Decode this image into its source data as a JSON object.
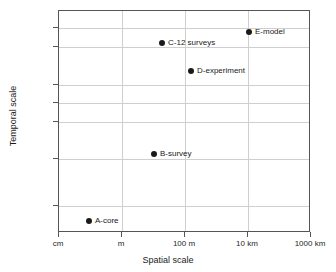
{
  "chart_data": {
    "type": "scatter",
    "title": "",
    "xlabel": "Spatial scale",
    "ylabel": "Temporal scale",
    "grid": true,
    "legend": "none",
    "x_tick_labels": [
      "cm",
      "m",
      "100 m",
      "10 km",
      "1000 km"
    ],
    "y_tick_labels": [
      "decade",
      "year",
      "month",
      "week",
      "day",
      "hour",
      "minute"
    ],
    "xlim": [
      "cm",
      "1000 km"
    ],
    "ylim": [
      "below minute",
      "above decade"
    ],
    "points": [
      {
        "label": "A-core",
        "x": "30 cm",
        "y": "under a minute"
      },
      {
        "label": "B-survey",
        "x": "50 m",
        "y": "hour"
      },
      {
        "label": "C-12 surveys",
        "x": "150 m",
        "y": "year"
      },
      {
        "label": "D-experiment",
        "x": "700 m",
        "y": "few months"
      },
      {
        "label": "E-model",
        "x": "10 km",
        "y": "decade"
      }
    ],
    "colors": {
      "marker": "#1a1a1a",
      "grid": "#cfcfcf",
      "frame": "#555555",
      "text": "#1a1a1a"
    }
  },
  "axes": {
    "x_ticks": [
      {
        "label": "cm",
        "pos_pct": 0
      },
      {
        "label": "m",
        "pos_pct": 25
      },
      {
        "label": "100 m",
        "pos_pct": 50
      },
      {
        "label": "10 km",
        "pos_pct": 75
      },
      {
        "label": "1000 km",
        "pos_pct": 100
      }
    ],
    "y_ticks": [
      {
        "label": "decade",
        "pos_px": 17
      },
      {
        "label": "year",
        "pos_px": 36
      },
      {
        "label": "month",
        "pos_px": 74
      },
      {
        "label": "week",
        "pos_px": 92
      },
      {
        "label": "day",
        "pos_px": 111
      },
      {
        "label": "hour",
        "pos_px": 148
      },
      {
        "label": "minute",
        "pos_px": 195
      }
    ]
  },
  "markers": [
    {
      "name": "A-core",
      "label": "A-core",
      "left_px": 88,
      "top_px": 220
    },
    {
      "name": "B-survey",
      "label": "B-survey",
      "left_px": 153,
      "top_px": 153
    },
    {
      "name": "C-12-surveys",
      "label": "C-12 surveys",
      "left_px": 161,
      "top_px": 42
    },
    {
      "name": "D-experiment",
      "label": "D-experiment",
      "left_px": 190,
      "top_px": 70
    },
    {
      "name": "E-model",
      "label": "E-model",
      "left_px": 248,
      "top_px": 31
    }
  ]
}
